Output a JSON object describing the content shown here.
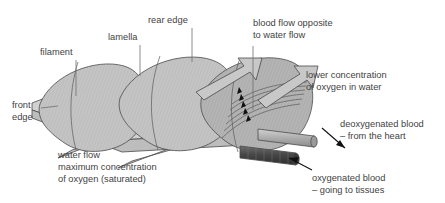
{
  "figure": {
    "title_implied": "Fish gill filament and lamellae countercurrent exchange",
    "background_color": "#ffffff",
    "text_color": "#3f3f3f"
  },
  "labels": {
    "filament": "filament",
    "lamella": "lamella",
    "rear_edge": "rear edge",
    "front_edge_line1": "front",
    "front_edge_line2": "edge",
    "blood_flow_line1": "blood flow opposite",
    "blood_flow_line2": "to water flow",
    "lower_oxygen_line1": "lower concentration",
    "lower_oxygen_line2": "of oxygen in water",
    "water_flow_line1": "water flow",
    "water_flow_line2": "maximum concentration",
    "water_flow_line3": "of oxygen (saturated)",
    "deoxygenated_line1": "deoxygenated blood",
    "deoxygenated_line2": "– from the heart",
    "oxygenated_line1": "oxygenated blood",
    "oxygenated_line2": "– going to tissues"
  },
  "colors": {
    "lamella_light": "#d9d9d9",
    "lamella_mid": "#c2c2c2",
    "lamella_dark": "#ababab",
    "filament_body": "#cfcfcf",
    "water_ribbon": "#d0d0d0",
    "arrow_fill": "#c8c8c8",
    "vessel_deoxygenated": "#b5b5b5",
    "vessel_oxygenated": "#4a4a4a",
    "outline_stroke": "#4a4a4a",
    "blood_arrow_black": "#111111"
  },
  "elements": {
    "water_arrow_count": 2,
    "blood_arrow_count": 5,
    "lamella_count": 3,
    "water_ribbon_count": 2,
    "vessel_count": 2
  }
}
